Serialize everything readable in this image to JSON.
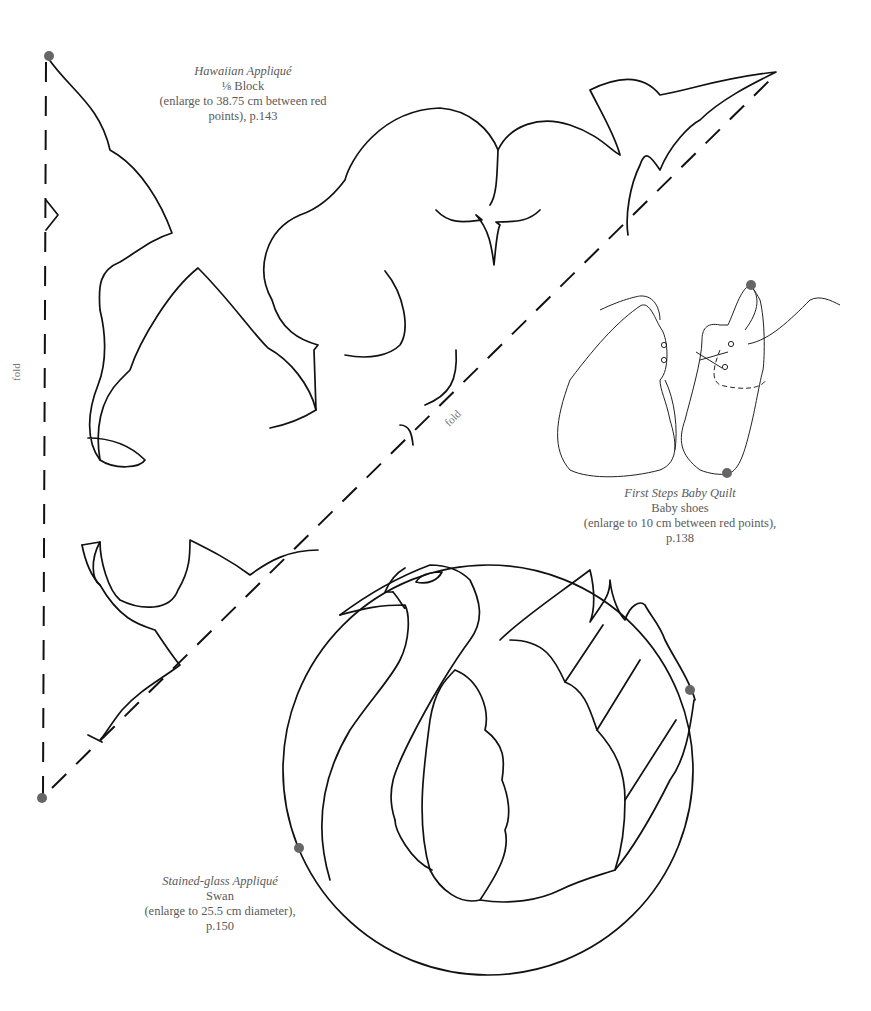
{
  "page": {
    "templates": [
      {
        "id": "hawaiian",
        "title": "Hawaiian Appliqué",
        "subtitle": "⅛ Block",
        "instruction": "(enlarge to 38.75 cm between red",
        "instruction_cont": "points), p.143"
      },
      {
        "id": "shoes",
        "title": "First Steps Baby Quilt",
        "subtitle": "Baby shoes",
        "instruction": "(enlarge to 10 cm between red points),",
        "instruction_cont": "p.138"
      },
      {
        "id": "swan",
        "title": "Stained-glass Appliqué",
        "subtitle": "Swan",
        "instruction": "(enlarge to 25.5 cm diameter),",
        "instruction_cont": "p.150"
      }
    ],
    "fold_labels": {
      "left": "fold",
      "diagonal": "fold"
    },
    "colors": {
      "ink": "#111111",
      "reference_point": "#666666",
      "caption_text": "#5a5a5a"
    }
  }
}
